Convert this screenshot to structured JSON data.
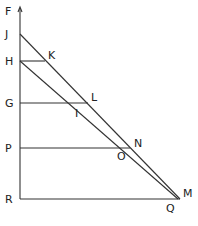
{
  "diagram": {
    "type": "geometric-construction",
    "points": [
      {
        "name": "F",
        "x": 20,
        "y": 8,
        "lx": 5,
        "ly": 15
      },
      {
        "name": "J",
        "x": 20,
        "y": 34,
        "lx": 5,
        "ly": 38
      },
      {
        "name": "H",
        "x": 20,
        "y": 61,
        "lx": 5,
        "ly": 65
      },
      {
        "name": "K",
        "x": 45,
        "y": 61,
        "lx": 48,
        "ly": 59
      },
      {
        "name": "G",
        "x": 20,
        "y": 103,
        "lx": 5,
        "ly": 107
      },
      {
        "name": "L",
        "x": 88,
        "y": 103,
        "lx": 91,
        "ly": 101
      },
      {
        "name": "I",
        "x": 78,
        "y": 103,
        "lx": 75,
        "ly": 117
      },
      {
        "name": "P",
        "x": 20,
        "y": 148,
        "lx": 5,
        "ly": 152
      },
      {
        "name": "N",
        "x": 130,
        "y": 148,
        "lx": 134,
        "ly": 147
      },
      {
        "name": "O",
        "x": 124,
        "y": 148,
        "lx": 117,
        "ly": 160
      },
      {
        "name": "R",
        "x": 20,
        "y": 199,
        "lx": 5,
        "ly": 203
      },
      {
        "name": "M",
        "x": 180,
        "y": 199,
        "lx": 183,
        "ly": 197
      },
      {
        "name": "Q",
        "x": 178,
        "y": 199,
        "lx": 166,
        "ly": 212
      }
    ],
    "segments": [
      {
        "name": "axis-FR",
        "from": "F",
        "to": "R"
      },
      {
        "name": "line-JM",
        "from": "J",
        "to": "M"
      },
      {
        "name": "line-HQ",
        "from": "H",
        "to": "Q"
      },
      {
        "name": "line-HK",
        "from": "H",
        "to": "K"
      },
      {
        "name": "line-GL",
        "from": "G",
        "to": "L"
      },
      {
        "name": "line-PN",
        "from": "P",
        "to": "N"
      },
      {
        "name": "line-RM",
        "from": "R",
        "to": "M"
      }
    ],
    "labels": {
      "F": "F",
      "J": "J",
      "H": "H",
      "K": "K",
      "G": "G",
      "L": "L",
      "I": "I",
      "P": "P",
      "N": "N",
      "O": "O",
      "R": "R",
      "M": "M",
      "Q": "Q"
    }
  }
}
